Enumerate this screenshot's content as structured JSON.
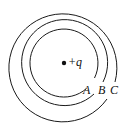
{
  "diagram": {
    "charge_label": "+q",
    "center": {
      "x": 64,
      "y": 63
    },
    "stroke_color": "#1a1a1a",
    "surfaces": [
      {
        "label": "A",
        "radius": 34
      },
      {
        "label": "B",
        "radius": 43
      },
      {
        "label": "C",
        "radius": 54
      }
    ]
  }
}
